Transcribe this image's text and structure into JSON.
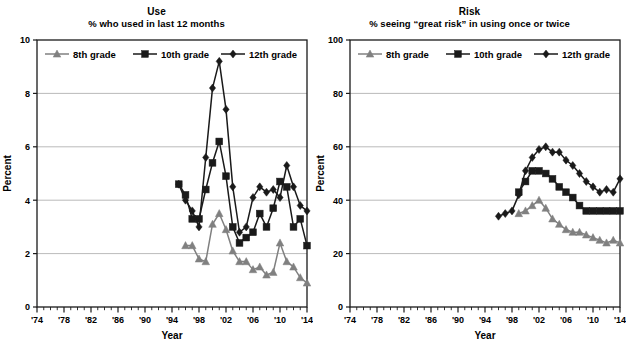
{
  "figure": {
    "background": "#ffffff",
    "axis_color": "#1a1a1a",
    "grid_color": "#a8a8a8"
  },
  "panels": [
    {
      "id": "use",
      "title": "Use",
      "subtitle": "% who used in last 12 months",
      "ylabel": "Percent",
      "xlabel": "Year",
      "ylim": [
        0,
        10
      ],
      "yticks": [
        0,
        2,
        4,
        6,
        8,
        10
      ],
      "yticklabels": [
        "0",
        "2",
        "4",
        "6",
        "8",
        "10"
      ],
      "xlim": [
        1974,
        2014
      ],
      "xticks": [
        1974,
        1978,
        1982,
        1986,
        1990,
        1994,
        1998,
        2002,
        2006,
        2010,
        2014
      ],
      "xticklabels": [
        "'74",
        "'78",
        "'82",
        "'86",
        "'90",
        "'94",
        "'98",
        "'02",
        "'06",
        "'10",
        "'14"
      ],
      "legend": [
        {
          "label": "8th grade",
          "marker": "triangle",
          "color": "#808080"
        },
        {
          "label": "10th grade",
          "marker": "square",
          "color": "#1a1a1a"
        },
        {
          "label": "12th grade",
          "marker": "diamond",
          "color": "#1a1a1a"
        }
      ]
    },
    {
      "id": "risk",
      "title": "Risk",
      "subtitle": "% seeing “great risk” in using once or twice",
      "ylabel": "Percent",
      "xlabel": "Year",
      "ylim": [
        0,
        100
      ],
      "yticks": [
        0,
        20,
        40,
        60,
        80,
        100
      ],
      "yticklabels": [
        "0",
        "20",
        "40",
        "60",
        "80",
        "100"
      ],
      "xlim": [
        1974,
        2014
      ],
      "xticks": [
        1974,
        1978,
        1982,
        1986,
        1990,
        1994,
        1998,
        2002,
        2006,
        2010,
        2014
      ],
      "xticklabels": [
        "'74",
        "'78",
        "'82",
        "'86",
        "'90",
        "'94",
        "'98",
        "'02",
        "'06",
        "'10",
        "'14"
      ],
      "legend": [
        {
          "label": "8th grade",
          "marker": "triangle",
          "color": "#808080"
        },
        {
          "label": "10th grade",
          "marker": "square",
          "color": "#1a1a1a"
        },
        {
          "label": "12th grade",
          "marker": "diamond",
          "color": "#1a1a1a"
        }
      ]
    }
  ],
  "chart_data": [
    {
      "type": "line",
      "title": "Use",
      "subtitle": "% who used in last 12 months",
      "xlabel": "Year",
      "ylabel": "Percent",
      "xlim": [
        1974,
        2014
      ],
      "ylim": [
        0,
        10
      ],
      "xticks": [
        1974,
        1978,
        1982,
        1986,
        1990,
        1994,
        1998,
        2002,
        2006,
        2010,
        2014
      ],
      "yticks": [
        0,
        2,
        4,
        6,
        8,
        10
      ],
      "grid": "horizontal",
      "legend_position": "top-inside",
      "series": [
        {
          "name": "8th grade",
          "marker": "triangle",
          "color": "#808080",
          "x": [
            1996,
            1997,
            1998,
            1999,
            2000,
            2001,
            2002,
            2003,
            2004,
            2005,
            2006,
            2007,
            2008,
            2009,
            2010,
            2011,
            2012,
            2013,
            2014
          ],
          "values": [
            2.3,
            2.3,
            1.8,
            1.7,
            3.1,
            3.5,
            2.9,
            2.1,
            1.7,
            1.7,
            1.4,
            1.5,
            1.2,
            1.3,
            2.4,
            1.7,
            1.5,
            1.1,
            0.9
          ]
        },
        {
          "name": "10th grade",
          "marker": "square",
          "color": "#1a1a1a",
          "x": [
            1995,
            1996,
            1997,
            1998,
            1999,
            2000,
            2001,
            2002,
            2003,
            2004,
            2005,
            2006,
            2007,
            2008,
            2009,
            2010,
            2011,
            2012,
            2013,
            2014
          ],
          "values": [
            4.6,
            4.2,
            3.3,
            3.3,
            4.4,
            5.4,
            6.2,
            4.9,
            3.0,
            2.4,
            2.6,
            2.8,
            3.5,
            3.0,
            3.7,
            4.7,
            4.5,
            3.0,
            3.3,
            2.3
          ]
        },
        {
          "name": "12th grade",
          "marker": "diamond",
          "color": "#1a1a1a",
          "x": [
            1995,
            1996,
            1997,
            1998,
            1999,
            2000,
            2001,
            2002,
            2003,
            2004,
            2005,
            2006,
            2007,
            2008,
            2009,
            2010,
            2011,
            2012,
            2013,
            2014
          ],
          "values": [
            4.6,
            4.0,
            3.6,
            3.0,
            5.6,
            8.2,
            9.2,
            7.4,
            4.5,
            2.8,
            3.0,
            4.1,
            4.5,
            4.3,
            4.4,
            4.1,
            5.3,
            4.5,
            3.8,
            3.6
          ]
        }
      ]
    },
    {
      "type": "line",
      "title": "Risk",
      "subtitle": "% seeing “great risk” in using once or twice",
      "xlabel": "Year",
      "ylabel": "Percent",
      "xlim": [
        1974,
        2014
      ],
      "ylim": [
        0,
        100
      ],
      "xticks": [
        1974,
        1978,
        1982,
        1986,
        1990,
        1994,
        1998,
        2002,
        2006,
        2010,
        2014
      ],
      "yticks": [
        0,
        20,
        40,
        60,
        80,
        100
      ],
      "grid": "horizontal",
      "legend_position": "top-inside",
      "series": [
        {
          "name": "8th grade",
          "marker": "triangle",
          "color": "#808080",
          "x": [
            1999,
            2000,
            2001,
            2002,
            2003,
            2004,
            2005,
            2006,
            2007,
            2008,
            2009,
            2010,
            2011,
            2012,
            2013,
            2014
          ],
          "values": [
            35.0,
            36.0,
            38.0,
            40.0,
            37.0,
            33.0,
            31.0,
            29.0,
            28.0,
            28.0,
            27.0,
            26.0,
            25.0,
            24.0,
            25.0,
            24.0
          ]
        },
        {
          "name": "10th grade",
          "marker": "square",
          "color": "#1a1a1a",
          "x": [
            1999,
            2000,
            2001,
            2002,
            2003,
            2004,
            2005,
            2006,
            2007,
            2008,
            2009,
            2010,
            2011,
            2012,
            2013,
            2014
          ],
          "values": [
            43.0,
            47.0,
            51.0,
            51.0,
            50.0,
            48.0,
            45.0,
            43.0,
            41.0,
            38.0,
            36.0,
            36.0,
            36.0,
            36.0,
            36.0,
            36.0
          ]
        },
        {
          "name": "12th grade",
          "marker": "diamond",
          "color": "#1a1a1a",
          "x": [
            1996,
            1997,
            1998,
            1999,
            2000,
            2001,
            2002,
            2003,
            2004,
            2005,
            2006,
            2007,
            2008,
            2009,
            2010,
            2011,
            2012,
            2013,
            2014
          ],
          "values": [
            34.0,
            35.0,
            36.0,
            42.0,
            51.0,
            56.0,
            59.0,
            60.0,
            58.0,
            58.0,
            55.0,
            53.0,
            50.0,
            47.0,
            45.0,
            43.0,
            44.0,
            43.0,
            48.0
          ]
        }
      ]
    }
  ]
}
